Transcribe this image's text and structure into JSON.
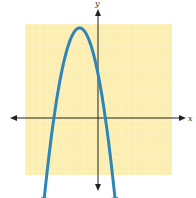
{
  "chart_data": {
    "type": "line",
    "title": "",
    "xlabel": "x",
    "ylabel": "y",
    "function": "y = -x^2 - 5x + 6",
    "xlim": [
      -10,
      10
    ],
    "ylim": [
      -8,
      14
    ],
    "grid": true,
    "vertex": [
      -2.5,
      12.25
    ],
    "x_intercepts": [
      -6,
      1
    ],
    "y_intercept": 6,
    "series": [
      {
        "name": "parabola",
        "x": [
          -7,
          -6,
          -5,
          -4,
          -3,
          -2.5,
          -2,
          -1,
          0,
          1,
          2
        ],
        "y": [
          -8,
          0,
          6,
          10,
          12,
          12.25,
          12,
          10,
          6,
          0,
          -8
        ]
      }
    ],
    "colors": {
      "curve": "#2e86b8",
      "grid_bg": "#fbeeb0",
      "grid_line": "#fffbe6",
      "axis": "#222222"
    }
  }
}
